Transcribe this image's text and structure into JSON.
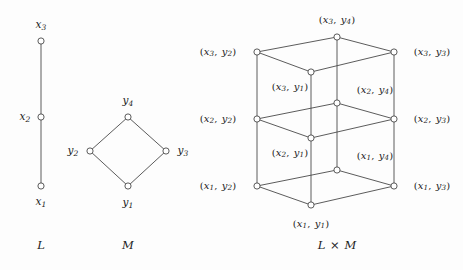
{
  "figure": {
    "background_color": "#fdfdfd",
    "line_color": "#4a4a4a",
    "node_fill": "#ffffff",
    "text_color": "#1b1b1b",
    "width": 463,
    "height": 270
  },
  "captions": {
    "left": "L",
    "middle": "M",
    "right": "L × M"
  },
  "diagrams": [
    {
      "name": "L",
      "type": "hasse-chain",
      "caption": "L",
      "caption_pos": {
        "x": 41,
        "y": 245
      },
      "nodes": [
        {
          "id": "x1",
          "label": "x1",
          "base": "x",
          "sub": "1",
          "x": 41,
          "y": 186,
          "label_x": 41,
          "label_y": 202,
          "label_pos": "below"
        },
        {
          "id": "x2",
          "label": "x2",
          "base": "x",
          "sub": "2",
          "x": 41,
          "y": 117,
          "label_x": 25,
          "label_y": 117,
          "label_pos": "left"
        },
        {
          "id": "x3",
          "label": "x3",
          "base": "x",
          "sub": "3",
          "x": 41,
          "y": 41,
          "label_x": 41,
          "label_y": 25,
          "label_pos": "above"
        }
      ],
      "edges": [
        [
          "x1",
          "x2"
        ],
        [
          "x2",
          "x3"
        ]
      ]
    },
    {
      "name": "M",
      "type": "hasse-diamond",
      "caption": "M",
      "caption_pos": {
        "x": 128,
        "y": 245
      },
      "nodes": [
        {
          "id": "y1",
          "label": "y1",
          "base": "y",
          "sub": "1",
          "x": 128,
          "y": 186,
          "label_x": 128,
          "label_y": 203,
          "label_pos": "below"
        },
        {
          "id": "y2",
          "label": "y2",
          "base": "y",
          "sub": "2",
          "x": 90,
          "y": 151,
          "label_x": 73,
          "label_y": 151,
          "label_pos": "left"
        },
        {
          "id": "y3",
          "label": "y3",
          "base": "y",
          "sub": "3",
          "x": 166,
          "y": 151,
          "label_x": 183,
          "label_y": 151,
          "label_pos": "right"
        },
        {
          "id": "y4",
          "label": "y4",
          "base": "y",
          "sub": "4",
          "x": 128,
          "y": 117,
          "label_x": 128,
          "label_y": 101,
          "label_pos": "above"
        }
      ],
      "edges": [
        [
          "y1",
          "y2"
        ],
        [
          "y1",
          "y3"
        ],
        [
          "y2",
          "y4"
        ],
        [
          "y3",
          "y4"
        ]
      ]
    },
    {
      "name": "LxM",
      "type": "hasse-product",
      "caption": "L × M",
      "caption_pos": {
        "x": 337,
        "y": 245
      },
      "nodes": [
        {
          "id": "x1y1",
          "first": "x",
          "first_sub": "1",
          "second": "y",
          "second_sub": "1",
          "x": 311,
          "y": 205,
          "label_x": 311,
          "label_y": 224,
          "label_pos": "below"
        },
        {
          "id": "x1y2",
          "first": "x",
          "first_sub": "1",
          "second": "y",
          "second_sub": "2",
          "x": 257,
          "y": 186,
          "label_x": 218,
          "label_y": 186,
          "label_pos": "left"
        },
        {
          "id": "x1y3",
          "first": "x",
          "first_sub": "1",
          "second": "y",
          "second_sub": "3",
          "x": 394,
          "y": 186,
          "label_x": 432,
          "label_y": 186,
          "label_pos": "right"
        },
        {
          "id": "x1y4",
          "first": "x",
          "first_sub": "1",
          "second": "y",
          "second_sub": "4",
          "x": 337,
          "y": 170,
          "label_x": 375,
          "label_y": 156,
          "label_pos": "upper-right"
        },
        {
          "id": "x2y1",
          "first": "x",
          "first_sub": "2",
          "second": "y",
          "second_sub": "1",
          "x": 311,
          "y": 138,
          "label_x": 290,
          "label_y": 153,
          "label_pos": "below-left"
        },
        {
          "id": "x2y2",
          "first": "x",
          "first_sub": "2",
          "second": "y",
          "second_sub": "2",
          "x": 257,
          "y": 119,
          "label_x": 218,
          "label_y": 119,
          "label_pos": "left"
        },
        {
          "id": "x2y3",
          "first": "x",
          "first_sub": "2",
          "second": "y",
          "second_sub": "3",
          "x": 394,
          "y": 119,
          "label_x": 432,
          "label_y": 119,
          "label_pos": "right"
        },
        {
          "id": "x2y4",
          "first": "x",
          "first_sub": "2",
          "second": "y",
          "second_sub": "4",
          "x": 337,
          "y": 103,
          "label_x": 375,
          "label_y": 90,
          "label_pos": "upper-right"
        },
        {
          "id": "x3y1",
          "first": "x",
          "first_sub": "3",
          "second": "y",
          "second_sub": "1",
          "x": 311,
          "y": 72,
          "label_x": 290,
          "label_y": 87,
          "label_pos": "below-left"
        },
        {
          "id": "x3y2",
          "first": "x",
          "first_sub": "3",
          "second": "y",
          "second_sub": "2",
          "x": 257,
          "y": 52,
          "label_x": 218,
          "label_y": 52,
          "label_pos": "left"
        },
        {
          "id": "x3y3",
          "first": "x",
          "first_sub": "3",
          "second": "y",
          "second_sub": "3",
          "x": 394,
          "y": 52,
          "label_x": 432,
          "label_y": 52,
          "label_pos": "right"
        },
        {
          "id": "x3y4",
          "first": "x",
          "first_sub": "3",
          "second": "y",
          "second_sub": "4",
          "x": 337,
          "y": 37,
          "label_x": 337,
          "label_y": 20,
          "label_pos": "above"
        }
      ],
      "edges": [
        [
          "x1y1",
          "x1y2"
        ],
        [
          "x1y1",
          "x1y3"
        ],
        [
          "x1y2",
          "x1y4"
        ],
        [
          "x1y3",
          "x1y4"
        ],
        [
          "x2y1",
          "x2y2"
        ],
        [
          "x2y1",
          "x2y3"
        ],
        [
          "x2y2",
          "x2y4"
        ],
        [
          "x2y3",
          "x2y4"
        ],
        [
          "x3y1",
          "x3y2"
        ],
        [
          "x3y1",
          "x3y3"
        ],
        [
          "x3y2",
          "x3y4"
        ],
        [
          "x3y3",
          "x3y4"
        ],
        [
          "x1y1",
          "x2y1"
        ],
        [
          "x1y2",
          "x2y2"
        ],
        [
          "x1y3",
          "x2y3"
        ],
        [
          "x1y4",
          "x2y4"
        ],
        [
          "x2y1",
          "x3y1"
        ],
        [
          "x2y2",
          "x3y2"
        ],
        [
          "x2y3",
          "x3y3"
        ],
        [
          "x2y4",
          "x3y4"
        ]
      ]
    }
  ]
}
